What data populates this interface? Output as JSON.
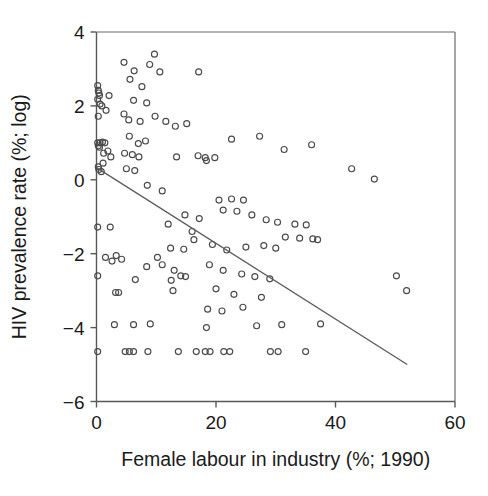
{
  "chart_data": {
    "type": "scatter",
    "title": "",
    "xlabel": "Female labour in industry (%; 1990)",
    "ylabel": "HIV prevalence rate (%; log)",
    "xlim": [
      0,
      60
    ],
    "ylim": [
      -6,
      4
    ],
    "xticks": [
      0,
      20,
      40,
      60
    ],
    "yticks": [
      -6,
      -4,
      -2,
      0,
      2,
      4
    ],
    "xtick_labels": [
      "0",
      "20",
      "40",
      "60"
    ],
    "ytick_labels": [
      "-6",
      "-4",
      "-2",
      "0",
      "2",
      "4"
    ],
    "grid": false,
    "legend": null,
    "marker": "open-circle",
    "marker_color": "#4a4a4c",
    "trendline": {
      "label": "linear fit",
      "x": [
        0,
        52
      ],
      "y": [
        0.33,
        -5.0
      ],
      "color": "#5a5a5c"
    },
    "points": [
      [
        0.2,
        2.55
      ],
      [
        0.3,
        2.42
      ],
      [
        0.4,
        2.35
      ],
      [
        0.5,
        2.28
      ],
      [
        0.2,
        2.18
      ],
      [
        0.6,
        2.05
      ],
      [
        0.9,
        2.0
      ],
      [
        0.3,
        1.72
      ],
      [
        1.6,
        1.88
      ],
      [
        2.1,
        2.28
      ],
      [
        0.2,
        1.0
      ],
      [
        0.6,
        1.0
      ],
      [
        1.0,
        1.02
      ],
      [
        1.4,
        1.0
      ],
      [
        0.3,
        0.92
      ],
      [
        0.5,
        0.88
      ],
      [
        1.2,
        0.72
      ],
      [
        1.9,
        0.78
      ],
      [
        2.4,
        0.62
      ],
      [
        1.1,
        0.45
      ],
      [
        0.3,
        0.35
      ],
      [
        0.4,
        0.28
      ],
      [
        0.8,
        0.22
      ],
      [
        0.2,
        -1.28
      ],
      [
        2.3,
        -1.28
      ],
      [
        0.2,
        -2.6
      ],
      [
        1.5,
        -2.1
      ],
      [
        3.3,
        -2.05
      ],
      [
        0.2,
        -4.65
      ],
      [
        3.2,
        -3.05
      ],
      [
        3.7,
        -3.05
      ],
      [
        3.0,
        -3.92
      ],
      [
        4.6,
        3.18
      ],
      [
        6.3,
        2.95
      ],
      [
        8.9,
        3.12
      ],
      [
        9.7,
        3.4
      ],
      [
        10.6,
        2.92
      ],
      [
        5.6,
        2.72
      ],
      [
        7.6,
        2.52
      ],
      [
        4.6,
        1.78
      ],
      [
        6.2,
        2.15
      ],
      [
        8.4,
        2.08
      ],
      [
        5.4,
        1.62
      ],
      [
        7.3,
        1.58
      ],
      [
        9.8,
        1.72
      ],
      [
        11.6,
        1.58
      ],
      [
        13.2,
        1.45
      ],
      [
        15.1,
        1.52
      ],
      [
        17.1,
        2.92
      ],
      [
        5.5,
        1.18
      ],
      [
        7.0,
        0.98
      ],
      [
        8.2,
        1.05
      ],
      [
        4.7,
        0.72
      ],
      [
        6.0,
        0.68
      ],
      [
        7.1,
        0.62
      ],
      [
        13.4,
        0.62
      ],
      [
        17.0,
        0.65
      ],
      [
        18.2,
        0.6
      ],
      [
        18.4,
        0.52
      ],
      [
        19.8,
        0.6
      ],
      [
        5.0,
        0.3
      ],
      [
        6.4,
        0.25
      ],
      [
        8.5,
        -0.15
      ],
      [
        11.0,
        -0.3
      ],
      [
        22.6,
        1.1
      ],
      [
        27.3,
        1.18
      ],
      [
        31.4,
        0.82
      ],
      [
        36.0,
        0.95
      ],
      [
        42.7,
        0.3
      ],
      [
        46.5,
        0.02
      ],
      [
        20.5,
        -0.55
      ],
      [
        22.6,
        -0.52
      ],
      [
        24.6,
        -0.55
      ],
      [
        21.2,
        -0.82
      ],
      [
        23.5,
        -0.85
      ],
      [
        26.0,
        -0.95
      ],
      [
        28.4,
        -1.08
      ],
      [
        30.3,
        -1.15
      ],
      [
        33.2,
        -1.2
      ],
      [
        35.1,
        -1.22
      ],
      [
        14.8,
        -0.95
      ],
      [
        17.2,
        -1.05
      ],
      [
        12.0,
        -1.2
      ],
      [
        16.0,
        -1.4
      ],
      [
        31.6,
        -1.55
      ],
      [
        34.0,
        -1.58
      ],
      [
        36.2,
        -1.6
      ],
      [
        37.0,
        -1.62
      ],
      [
        25.0,
        -1.82
      ],
      [
        28.0,
        -1.78
      ],
      [
        30.0,
        -1.85
      ],
      [
        21.8,
        -1.9
      ],
      [
        12.4,
        -1.85
      ],
      [
        14.6,
        -1.88
      ],
      [
        16.3,
        -1.62
      ],
      [
        19.4,
        -1.75
      ],
      [
        10.2,
        -2.1
      ],
      [
        2.6,
        -2.2
      ],
      [
        4.2,
        -2.15
      ],
      [
        8.4,
        -2.35
      ],
      [
        11.0,
        -2.3
      ],
      [
        13.0,
        -2.45
      ],
      [
        14.1,
        -2.6
      ],
      [
        14.9,
        -2.62
      ],
      [
        6.5,
        -2.7
      ],
      [
        12.5,
        -2.72
      ],
      [
        18.9,
        -2.3
      ],
      [
        21.2,
        -2.45
      ],
      [
        24.3,
        -2.55
      ],
      [
        26.5,
        -2.62
      ],
      [
        29.0,
        -2.68
      ],
      [
        12.8,
        -3.0
      ],
      [
        20.0,
        -2.95
      ],
      [
        23.0,
        -3.1
      ],
      [
        27.6,
        -3.18
      ],
      [
        18.6,
        -3.5
      ],
      [
        21.0,
        -3.55
      ],
      [
        24.5,
        -3.45
      ],
      [
        18.4,
        -4.0
      ],
      [
        6.2,
        -3.92
      ],
      [
        9.0,
        -3.9
      ],
      [
        26.8,
        -3.95
      ],
      [
        31.0,
        -3.92
      ],
      [
        37.5,
        -3.9
      ],
      [
        50.2,
        -2.6
      ],
      [
        51.9,
        -3.0
      ],
      [
        4.8,
        -4.65
      ],
      [
        5.5,
        -4.65
      ],
      [
        6.2,
        -4.65
      ],
      [
        8.6,
        -4.65
      ],
      [
        13.7,
        -4.65
      ],
      [
        16.7,
        -4.65
      ],
      [
        18.2,
        -4.65
      ],
      [
        19.0,
        -4.65
      ],
      [
        21.3,
        -4.65
      ],
      [
        22.3,
        -4.65
      ],
      [
        29.1,
        -4.65
      ],
      [
        30.4,
        -4.65
      ],
      [
        35.0,
        -4.65
      ]
    ]
  }
}
